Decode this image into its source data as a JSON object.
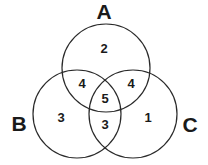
{
  "diagram": {
    "type": "venn",
    "sets": [
      {
        "id": "A",
        "label": "A",
        "cx": 106,
        "cy": 68,
        "r": 44,
        "label_x": 104,
        "label_y": 19
      },
      {
        "id": "B",
        "label": "B",
        "cx": 77,
        "cy": 114,
        "r": 44,
        "label_x": 19,
        "label_y": 131
      },
      {
        "id": "C",
        "label": "C",
        "cx": 133,
        "cy": 114,
        "r": 44,
        "label_x": 190,
        "label_y": 132
      }
    ],
    "regions": [
      {
        "name": "A only",
        "value": "2",
        "x": 104,
        "y": 53
      },
      {
        "name": "A and B",
        "value": "4",
        "x": 82,
        "y": 88
      },
      {
        "name": "A and C",
        "value": "4",
        "x": 131,
        "y": 88
      },
      {
        "name": "A and B and C",
        "value": "5",
        "x": 105,
        "y": 103
      },
      {
        "name": "B only",
        "value": "3",
        "x": 61,
        "y": 122
      },
      {
        "name": "B and C",
        "value": "3",
        "x": 105,
        "y": 129
      },
      {
        "name": "C only",
        "value": "1",
        "x": 148,
        "y": 122
      }
    ]
  }
}
